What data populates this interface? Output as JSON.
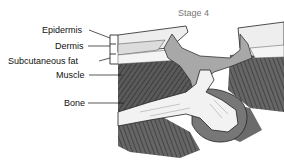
{
  "diagram": {
    "title": "Stage 4",
    "labels": {
      "epidermis": "Epidermis",
      "dermis": "Dermis",
      "subcutaneous_fat": "Subcutaneous fat",
      "muscle": "Muscle",
      "bone": "Bone"
    },
    "colors": {
      "muscle": "#555555",
      "wound": "#a8a8a8",
      "bone": "#f2f2f2",
      "skin": "#e6e6e6",
      "outline": "#222222"
    }
  }
}
